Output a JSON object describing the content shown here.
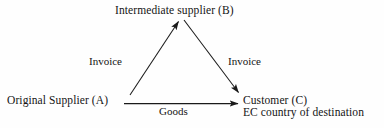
{
  "diagram": {
    "type": "triangular-flow-diagram",
    "line_color": "#1a1a1a",
    "background_color": "#fefefe",
    "nodes": [
      {
        "id": "B",
        "label": "Intermediate supplier (B)",
        "position": "top-center"
      },
      {
        "id": "A",
        "label": "Original Supplier (A)",
        "position": "bottom-left"
      },
      {
        "id": "C",
        "label": "Customer (C)",
        "sublabel": "EC country of destination",
        "position": "bottom-right"
      }
    ],
    "edges": [
      {
        "id": "a-to-b",
        "label": "Invoice",
        "from": "A",
        "to": "B",
        "arrow": "to-B"
      },
      {
        "id": "b-to-c",
        "label": "Invoice",
        "from": "B",
        "to": "C",
        "arrow": "to-C"
      },
      {
        "id": "a-to-c",
        "label": "Goods",
        "from": "A",
        "to": "C",
        "arrow": "to-C"
      }
    ]
  }
}
